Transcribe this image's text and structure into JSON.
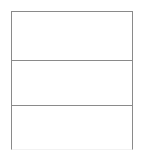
{
  "page": {
    "background_color": "#ffffff",
    "width": 143,
    "height": 156
  },
  "grid": {
    "name": "blank-table",
    "border_color": "#8a8a8a",
    "bottom_border_color": "#f2f2f2",
    "fill_color": "#ffffff",
    "border_width_px": 1,
    "row_count": 3,
    "column_count": 1,
    "left_px": 11,
    "top_px": 11,
    "width_px": 122,
    "height_px": 139,
    "divider_positions_px": [
      60,
      105
    ],
    "rows": [
      {
        "label": "",
        "height_px": 49
      },
      {
        "label": "",
        "height_px": 45
      },
      {
        "label": "",
        "height_px": 43
      }
    ]
  }
}
